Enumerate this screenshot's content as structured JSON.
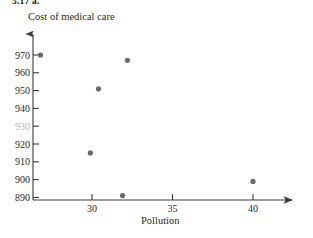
{
  "exercise": {
    "number": "5.17  a."
  },
  "chart_data": {
    "type": "scatter",
    "title": "",
    "ylabel": "Cost of medical care",
    "xlabel": "Pollution",
    "xlim": [
      26,
      42
    ],
    "ylim": [
      886,
      976
    ],
    "grid": false,
    "legend": null,
    "xticks": [
      30,
      35,
      40
    ],
    "yticks": [
      890,
      900,
      910,
      920,
      930,
      940,
      950,
      960,
      970
    ],
    "ytick_labels": [
      "890",
      "900",
      "910",
      "920",
      "930",
      "940",
      "950",
      "960",
      "970"
    ],
    "xtick_labels": [
      "30",
      "35",
      "40"
    ],
    "faded_ytick_label": "930",
    "point_color": "#6a6a6a",
    "axis_color": "#3a3a3a",
    "points": [
      {
        "x": 26.8,
        "y": 970
      },
      {
        "x": 29.9,
        "y": 915
      },
      {
        "x": 30.4,
        "y": 951
      },
      {
        "x": 31.9,
        "y": 891
      },
      {
        "x": 32.2,
        "y": 967
      },
      {
        "x": 40.0,
        "y": 899
      }
    ]
  }
}
